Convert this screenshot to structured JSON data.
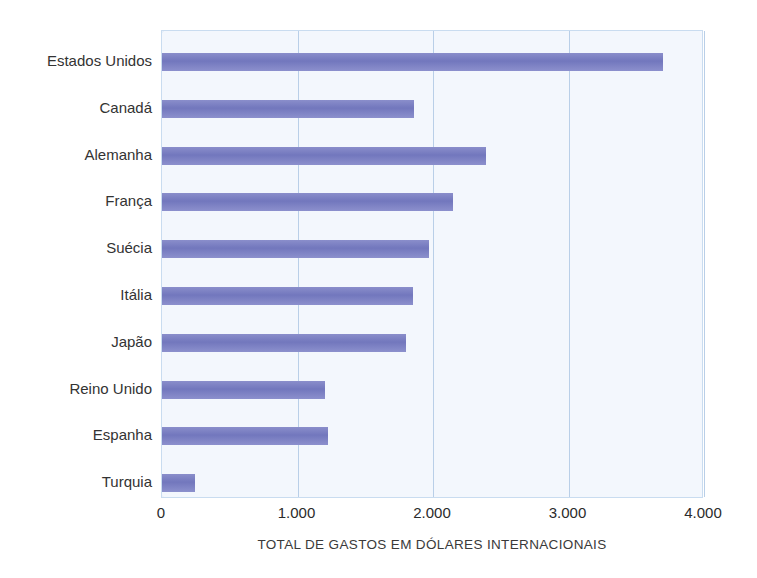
{
  "chart_data": {
    "type": "bar",
    "orientation": "horizontal",
    "title": "",
    "xlabel": "TOTAL DE GASTOS EM DÓLARES INTERNACIONAIS",
    "ylabel": "",
    "categories": [
      "Estados Unidos",
      "Canadá",
      "Alemanha",
      "França",
      "Suécia",
      "Itália",
      "Japão",
      "Reino Unido",
      "Espanha",
      "Turquia"
    ],
    "values": [
      3700,
      1860,
      2390,
      2150,
      1970,
      1850,
      1800,
      1200,
      1225,
      240
    ],
    "xlim": [
      0,
      4000
    ],
    "xticks": [
      0,
      1000,
      2000,
      3000,
      4000
    ],
    "xtick_labels": [
      "0",
      "1.000",
      "2.000",
      "3.000",
      "4.000"
    ],
    "grid": true,
    "legend": false,
    "colors": {
      "bar": "#7277bd",
      "plot_background": "#f3f7fd",
      "gridline": "#b9cfe8",
      "text": "#333333"
    }
  }
}
